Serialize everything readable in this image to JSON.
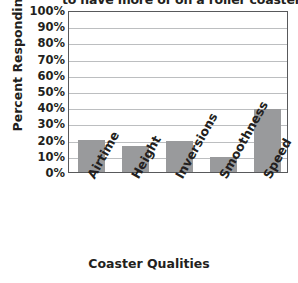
{
  "chart_data": {
    "type": "bar",
    "title": "to have more of on a roller coaster?",
    "xlabel": "Coaster Qualities",
    "ylabel": "Percent Responding",
    "categories": [
      "Airtime",
      "Height",
      "Inversions",
      "Smoothness",
      "Speed"
    ],
    "values": [
      20,
      16,
      19,
      9,
      39
    ],
    "value_labels": [
      "20%",
      "16%",
      "19%",
      "9%",
      "39%"
    ],
    "ylim": [
      0,
      100
    ],
    "ytick_labels": [
      "100%",
      "90%",
      "80%",
      "70%",
      "60%",
      "50%",
      "40%",
      "30%",
      "20%",
      "10%",
      "0%"
    ],
    "ytick_values": [
      100,
      90,
      80,
      70,
      60,
      50,
      40,
      30,
      20,
      10,
      0
    ],
    "grid": true,
    "legend": "none",
    "bar_color": "#999a9c",
    "gridline_color": "#bcbec0",
    "axis_color": "#58595b",
    "background_color": "#ffffff"
  }
}
